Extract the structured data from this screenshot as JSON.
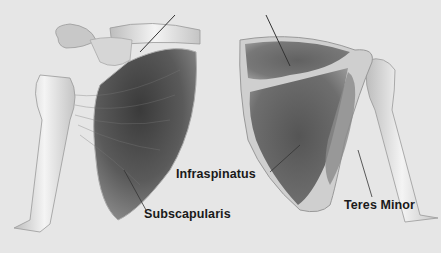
{
  "figure": {
    "background_color": "#e6e6e6",
    "labels": [
      {
        "text": "Infraspinatus",
        "x": 176,
        "y": 167
      },
      {
        "text": "Subscapularis",
        "x": 144,
        "y": 207
      },
      {
        "text": "Teres Minor",
        "x": 344,
        "y": 198
      }
    ]
  }
}
